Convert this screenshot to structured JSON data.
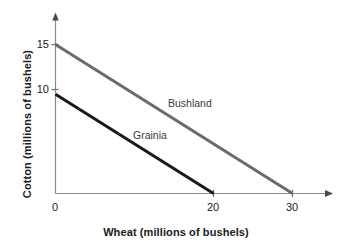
{
  "chart_data": {
    "type": "line",
    "title": "",
    "subtitle": "",
    "xlabel": "Wheat (millions of bushels)",
    "ylabel": "Cotton (millions of bushels)",
    "xlim": [
      0,
      34
    ],
    "ylim": [
      0,
      17
    ],
    "xticks": [
      {
        "value": 0,
        "label": "0"
      },
      {
        "value": 20,
        "label": "20"
      },
      {
        "value": 30,
        "label": "30"
      }
    ],
    "yticks": [
      {
        "value": 10,
        "label": "10"
      },
      {
        "value": 15,
        "label": "15"
      }
    ],
    "grid": false,
    "legend_position": "inline-annotations",
    "axis_arrows": true,
    "series": [
      {
        "name": "Bushland",
        "color": "#6b6b6b",
        "x": [
          0,
          30
        ],
        "values": [
          15,
          0
        ],
        "annotation": {
          "text": "Bushland",
          "x": 14.5,
          "y": 7.6
        }
      },
      {
        "name": "Grainia",
        "color": "#1a1a1a",
        "x": [
          0,
          20
        ],
        "values": [
          10,
          0
        ],
        "annotation": {
          "text": "Grainia",
          "x": 10.0,
          "y": 4.4
        }
      }
    ],
    "annotations": [
      {
        "text": "Bushland",
        "series": "Bushland"
      },
      {
        "text": "Grainia",
        "series": "Grainia"
      }
    ],
    "colors": {
      "background": "#ffffff",
      "axis": "#8a8a8a",
      "text": "#1a1a1a",
      "bushland_line": "#6b6b6b",
      "grainia_line": "#1a1a1a"
    }
  },
  "labels": {
    "x_axis_title": "Wheat (millions of bushels)",
    "y_axis_title": "Cotton (millions of bushels)",
    "x_tick_0": "0",
    "x_tick_20": "20",
    "x_tick_30": "30",
    "y_tick_10": "10",
    "y_tick_15": "15",
    "series_bushland": "Bushland",
    "series_grainia": "Grainia"
  }
}
